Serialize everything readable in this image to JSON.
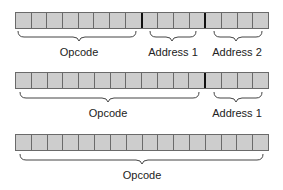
{
  "diagram": {
    "cell_color": "#cdcdcd",
    "border_color": "#6a6a6a",
    "formats": [
      {
        "name": "three-field",
        "total_cells": 16,
        "fields": [
          {
            "label": "Opcode",
            "cells": 8
          },
          {
            "label": "Address 1",
            "cells": 4
          },
          {
            "label": "Address 2",
            "cells": 4
          }
        ]
      },
      {
        "name": "two-field",
        "total_cells": 16,
        "fields": [
          {
            "label": "Opcode",
            "cells": 12
          },
          {
            "label": "Address 1",
            "cells": 4
          }
        ]
      },
      {
        "name": "one-field",
        "total_cells": 16,
        "fields": [
          {
            "label": "Opcode",
            "cells": 16
          }
        ]
      }
    ]
  },
  "labels": {
    "r1_opcode": "Opcode",
    "r1_addr1": "Address 1",
    "r1_addr2": "Address 2",
    "r2_opcode": "Opcode",
    "r2_addr1": "Address 1",
    "r3_opcode": "Opcode"
  }
}
